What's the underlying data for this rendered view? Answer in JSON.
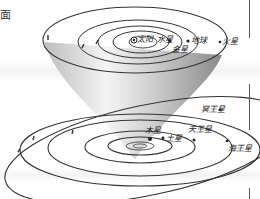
{
  "caption_fragment": "面",
  "upper_plane": {
    "sun": "太阳",
    "planets": [
      "水星",
      "金星",
      "地球",
      "火星"
    ]
  },
  "lower_plane": {
    "planets": [
      "木星",
      "土星",
      "天王星",
      "海王星",
      "冥王星"
    ]
  },
  "labels": {
    "sun": "太阳",
    "mercury": "水星",
    "venus": "金星",
    "earth": "地球",
    "mars": "火星",
    "jupiter": "木星",
    "saturn": "土星",
    "uranus": "天王星",
    "neptune": "海王星",
    "pluto": "冥王星"
  },
  "colors": {
    "line": "#333333",
    "cone_dark": "#9a9a9a",
    "cone_light": "#f2f2f2",
    "background": "#ffffff"
  }
}
